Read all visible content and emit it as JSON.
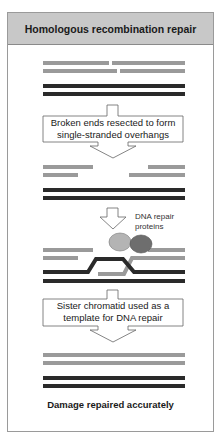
{
  "title": "Homologous recombination repair",
  "steps": [
    {
      "label_line1": "Broken ends resected to form",
      "label_line2": "single-stranded overhangs"
    },
    {
      "label_line1": "Sister chromatid used as a",
      "label_line2": "template for DNA repair"
    }
  ],
  "annotation": {
    "line1": "DNA repair",
    "line2": "proteins"
  },
  "footer": "Damage repaired accurately",
  "colors": {
    "broken_strand": "#9a9a9a",
    "sister_strand": "#2a2a2a",
    "header_bg": "#c8c8c8",
    "protein_light": "#b4b4b4",
    "protein_dark": "#6e6e6e"
  }
}
